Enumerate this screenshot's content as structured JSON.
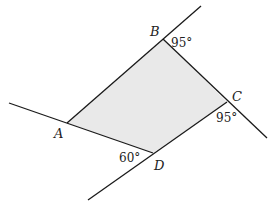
{
  "diagram": {
    "fill_color": "#e9e9e9",
    "line_color": "#1a1a1a",
    "vertices": {
      "A": {
        "label": "A",
        "x": 67,
        "y": 123
      },
      "B": {
        "label": "B",
        "x": 163,
        "y": 39
      },
      "C": {
        "label": "C",
        "x": 227,
        "y": 102
      },
      "D": {
        "label": "D",
        "x": 153,
        "y": 153
      }
    },
    "angles": {
      "B": "95°",
      "C": "95°",
      "D": "60°"
    }
  }
}
